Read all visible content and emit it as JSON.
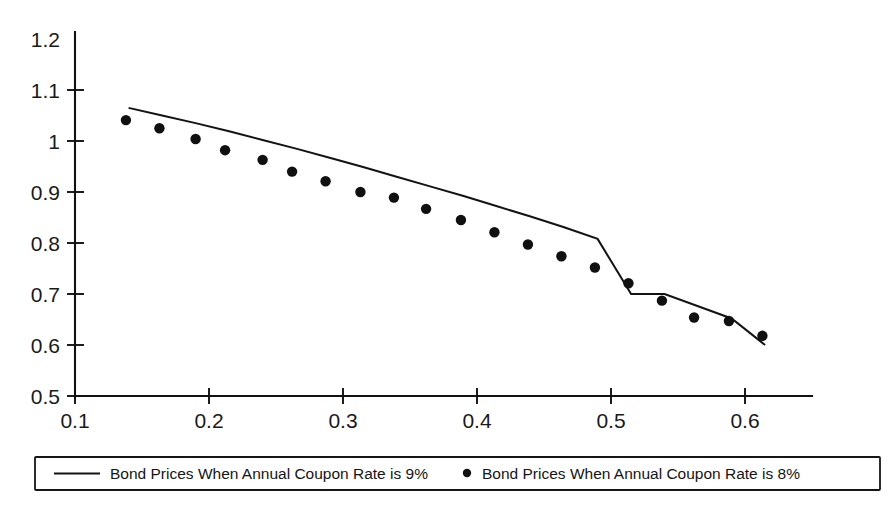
{
  "chart_data": {
    "type": "scatter",
    "title": "",
    "xlabel": "",
    "ylabel": "",
    "xlim": [
      0.1,
      0.6
    ],
    "ylim": [
      0.5,
      1.2
    ],
    "xticks": [
      0.1,
      0.2,
      0.3,
      0.4,
      0.5,
      0.6
    ],
    "xtick_labels": [
      "0.1",
      "0.2",
      "0.3",
      "0.4",
      "0.5",
      "0.6"
    ],
    "yticks": [
      0.5,
      0.6,
      0.7,
      0.8,
      0.9,
      1.0,
      1.1,
      1.2
    ],
    "ytick_labels": [
      "0.5",
      "0.6",
      "0.7",
      "0.8",
      "0.9",
      "1",
      "1.1",
      "1.2"
    ],
    "grid": false,
    "legend_position": "bottom",
    "series": [
      {
        "name": "Bond Prices When Annual Coupon Rate is 9%",
        "marker": "line",
        "color": "#131313",
        "x": [
          0.14,
          0.165,
          0.19,
          0.215,
          0.24,
          0.265,
          0.29,
          0.315,
          0.34,
          0.365,
          0.39,
          0.415,
          0.44,
          0.465,
          0.49,
          0.515,
          0.54,
          0.565,
          0.59,
          0.615
        ],
        "values": [
          1.065,
          1.05,
          1.035,
          1.019,
          1.002,
          0.985,
          0.967,
          0.949,
          0.93,
          0.911,
          0.892,
          0.872,
          0.852,
          0.831,
          0.808,
          0.7,
          0.7,
          0.676,
          0.652,
          0.6
        ]
      },
      {
        "name": "Bond Prices When Annual Coupon Rate is 8%",
        "marker": "dot",
        "color": "#101010",
        "x": [
          0.138,
          0.163,
          0.19,
          0.212,
          0.24,
          0.262,
          0.287,
          0.313,
          0.338,
          0.362,
          0.388,
          0.413,
          0.438,
          0.463,
          0.488,
          0.513,
          0.538,
          0.562,
          0.588,
          0.613
        ],
        "values": [
          1.041,
          1.025,
          1.004,
          0.982,
          0.963,
          0.94,
          0.921,
          0.9,
          0.889,
          0.867,
          0.845,
          0.821,
          0.797,
          0.774,
          0.752,
          0.721,
          0.687,
          0.654,
          0.647,
          0.618
        ]
      }
    ]
  },
  "legend": {
    "entries": [
      {
        "label": "Bond Prices When Annual Coupon Rate is 9%",
        "marker": "line-swatch"
      },
      {
        "label": "Bond Prices When Annual Coupon Rate is 8%",
        "marker": "dot-swatch"
      }
    ]
  }
}
